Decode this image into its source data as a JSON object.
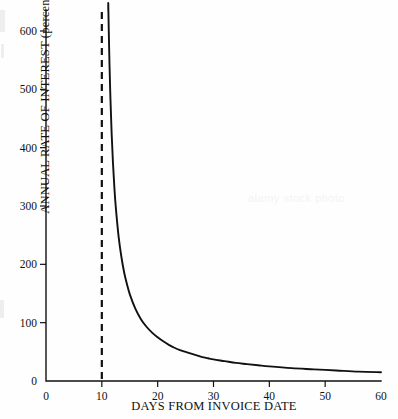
{
  "figure": {
    "background_color": "#fefefe",
    "ink_color": "#111111",
    "watermark_text": "alamy stock photo"
  },
  "chart_data": {
    "type": "line",
    "title": "",
    "subtitle": "",
    "xlabel": "DAYS FROM INVOICE DATE",
    "ylabel": "ANNUAL RATE OF INTEREST (percent)",
    "xlim": [
      0,
      60
    ],
    "ylim": [
      0,
      650
    ],
    "grid": false,
    "legend": "none",
    "x_ticks": [
      0,
      10,
      20,
      30,
      40,
      50,
      60
    ],
    "x_tick_labels": [
      "0",
      "10",
      "20",
      "30",
      "40",
      "50",
      "60"
    ],
    "y_ticks": [
      0,
      100,
      200,
      300,
      400,
      500,
      600
    ],
    "y_tick_labels": [
      "0",
      "100",
      "200",
      "300",
      "400",
      "500",
      "600"
    ],
    "series": [
      {
        "name": "Annual rate of interest on forgone discount",
        "style": "solid",
        "color": "#111111",
        "x": [
          11.15,
          11.3,
          11.5,
          11.75,
          12,
          12.25,
          12.5,
          13,
          13.5,
          14,
          14.5,
          15,
          16,
          17,
          18,
          19,
          20,
          21,
          22,
          23,
          24,
          25,
          26,
          27,
          28,
          29,
          30,
          32,
          34,
          36,
          38,
          40,
          44,
          48,
          52,
          56,
          60
        ],
        "y": [
          648,
          574,
          497,
          426,
          373,
          331,
          298,
          248,
          213,
          186,
          166,
          149,
          124,
          106,
          93,
          83,
          75,
          68,
          62,
          57,
          53,
          50,
          47,
          44,
          41,
          39,
          37,
          34,
          31,
          29,
          27,
          25,
          22,
          20,
          18,
          16,
          15
        ]
      }
    ],
    "annotations": [
      {
        "name": "discount-period-asymptote",
        "type": "vertical-dashed-line",
        "x": 10,
        "style": "dashed",
        "color": "#111111",
        "description": "Vertical asymptote at the end of the 10-day discount period"
      }
    ]
  }
}
